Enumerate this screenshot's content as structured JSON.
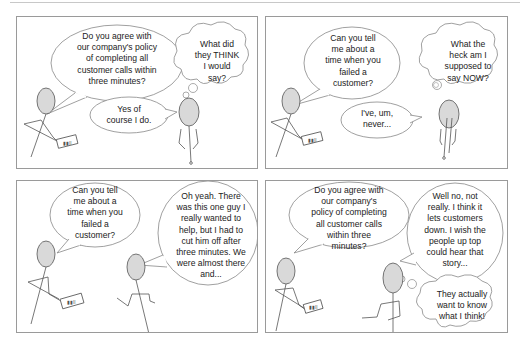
{
  "comic": {
    "panels": [
      {
        "id": 1,
        "interviewer_speech": "Do you agree with\nour company's policy\nof completing all\ncustomer calls within\nthree minutes?",
        "candidate_thought": "What did\nthey THINK\nI would\nsay?",
        "candidate_speech": "Yes of\ncourse I do."
      },
      {
        "id": 2,
        "interviewer_speech": "Can you tell\nme about a\ntime when you\nfailed a\ncustomer?",
        "candidate_thought": "What the\nheck am I\nsupposed to\nsay NOW?",
        "candidate_speech": "I've, um,\nnever..."
      },
      {
        "id": 3,
        "interviewer_speech": "Can you tell\nme about a\ntime when you\nfailed a\ncustomer?",
        "candidate_speech": "Oh yeah. There\nwas this one guy I\nreally wanted to\nhelp, but I had to\ncut him off after\nthree minutes. We\nwere almost there\nand..."
      },
      {
        "id": 4,
        "interviewer_speech": "Do you agree with\nour company's\npolicy of completing\nall customer calls\nwithin three\nminutes?",
        "candidate_speech": "Well no, not\nreally. I think it\nlets customers\ndown. I wish the\npeople up top\ncould hear that\nstory...",
        "candidate_thought": "They actually\nwant to know\nwhat I think!"
      }
    ]
  },
  "colors": {
    "border": "#9a9a9a",
    "line": "#555555",
    "head_fill": "#d9d9d9",
    "text": "#222222"
  }
}
